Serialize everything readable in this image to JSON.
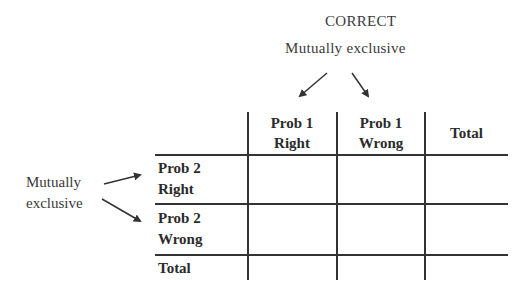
{
  "top_annotation": {
    "title": "CORRECT",
    "subtitle": "Mutually exclusive"
  },
  "side_annotation": {
    "line1": "Mutually",
    "line2": "exclusive"
  },
  "table": {
    "column_headers": [
      {
        "line1": "Prob 1",
        "line2": "Right"
      },
      {
        "line1": "Prob 1",
        "line2": "Wrong"
      },
      {
        "line1": "Total",
        "line2": ""
      }
    ],
    "row_headers": [
      {
        "line1": "Prob 2",
        "line2": "Right"
      },
      {
        "line1": "Prob 2",
        "line2": "Wrong"
      },
      {
        "line1": "Total",
        "line2": ""
      }
    ],
    "cells": [
      [
        "",
        "",
        ""
      ],
      [
        "",
        "",
        ""
      ],
      [
        "",
        "",
        ""
      ]
    ]
  },
  "colors": {
    "lines": "#333333",
    "text": "#2b2b2b"
  }
}
